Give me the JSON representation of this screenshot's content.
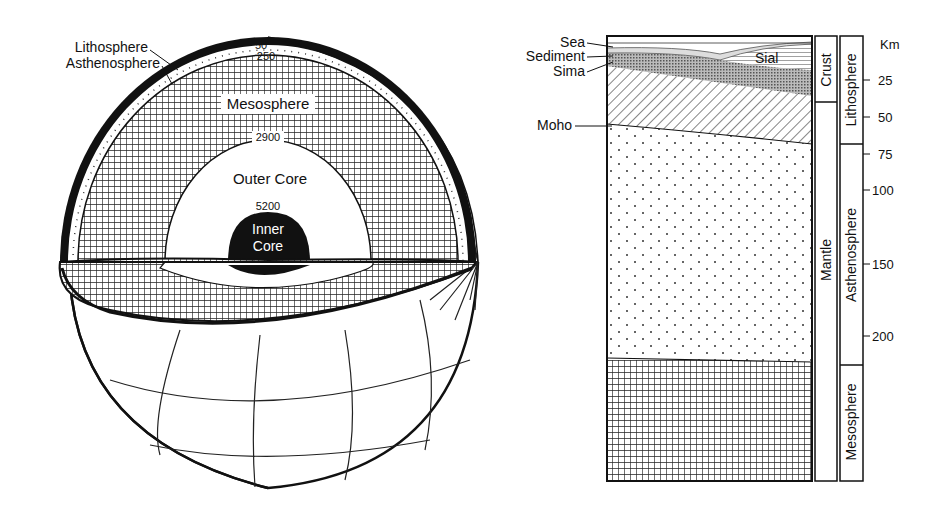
{
  "globe": {
    "labels": {
      "lithosphere": "Lithosphere",
      "asthenosphere": "Asthenosphere",
      "mesosphere": "Mesosphere",
      "outer_core": "Outer Core",
      "inner_core_1": "Inner",
      "inner_core_2": "Core"
    },
    "depths": {
      "d50": "50",
      "d250": "250",
      "d2900": "2900",
      "d5200": "5200"
    }
  },
  "column": {
    "left_labels": {
      "sea": "Sea",
      "sediment": "Sediment",
      "sima": "Sima",
      "moho": "Moho"
    },
    "inner_label_sial": "Sial",
    "band1": {
      "crust": "Crust",
      "mantle": "Mantle"
    },
    "band2": {
      "lithosphere": "Lithosphere",
      "asthenosphere": "Asthenosphere",
      "mesosphere": "Mesosphere"
    },
    "scale": {
      "unit": "Km",
      "ticks": [
        "25",
        "50",
        "75",
        "100",
        "150",
        "200"
      ]
    }
  }
}
